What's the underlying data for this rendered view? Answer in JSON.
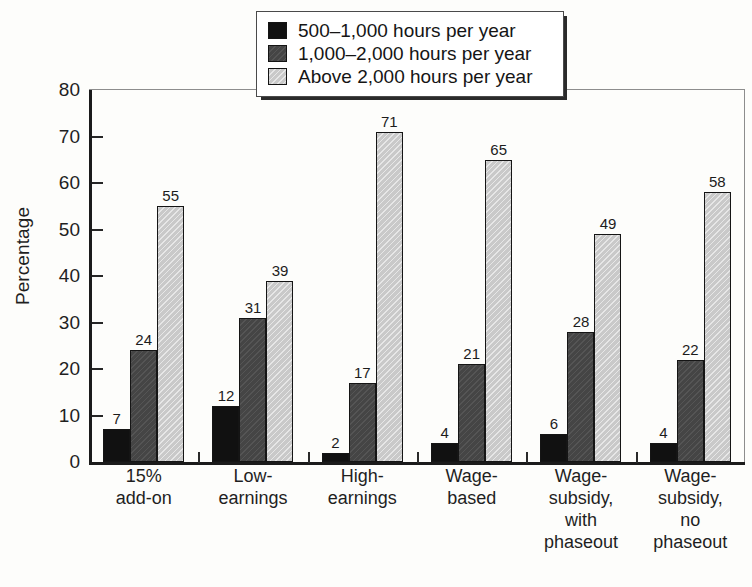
{
  "chart_data": {
    "type": "bar",
    "title": "",
    "subtitle": "",
    "xlabel": "",
    "ylabel": "Percentage",
    "ylim": [
      0,
      80
    ],
    "yticks": [
      0,
      10,
      20,
      30,
      40,
      50,
      60,
      70,
      80
    ],
    "ytick_labels": [
      "0",
      "10",
      "20",
      "30",
      "40",
      "50",
      "60",
      "70",
      "80"
    ],
    "grid": false,
    "legend_position": "top-center",
    "data_labels": true,
    "categories": [
      "15%\nadd-on",
      "Low-\nearnings",
      "High-\nearnings",
      "Wage-\nbased",
      "Wage-\nsubsidy,\nwith\nphaseout",
      "Wage-\nsubsidy,\nno\nphaseout"
    ],
    "category_lines": [
      [
        "15%",
        "add-on"
      ],
      [
        "Low-",
        "earnings"
      ],
      [
        "High-",
        "earnings"
      ],
      [
        "Wage-",
        "based"
      ],
      [
        "Wage-",
        "subsidy,",
        "with",
        "phaseout"
      ],
      [
        "Wage-",
        "subsidy,",
        "no",
        "phaseout"
      ]
    ],
    "series": [
      {
        "name": "500–1,000 hours per year",
        "color": "#111111",
        "values": [
          7,
          12,
          2,
          4,
          6,
          4
        ]
      },
      {
        "name": "1,000–2,000 hours per year",
        "color": "#454545",
        "values": [
          24,
          31,
          17,
          21,
          28,
          22
        ]
      },
      {
        "name": "Above 2,000 hours per year",
        "color": "#c9c9c9",
        "values": [
          55,
          39,
          71,
          65,
          49,
          58
        ]
      }
    ]
  },
  "legend": {
    "items": [
      {
        "label": "500–1,000 hours per year",
        "swatch": "s0"
      },
      {
        "label": "1,000–2,000 hours per year",
        "swatch": "s1"
      },
      {
        "label": "Above 2,000 hours per year",
        "swatch": "s2"
      }
    ]
  },
  "axes": {
    "y_title": "Percentage"
  }
}
